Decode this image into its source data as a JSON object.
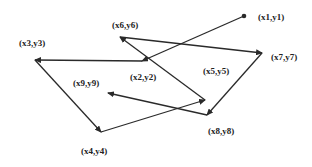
{
  "diagram": {
    "type": "directed-path",
    "colors": {
      "line": "#2a2a2a",
      "label": "#222222",
      "background": "#ffffff"
    },
    "start_marker": "dot",
    "points": [
      {
        "id": "p1",
        "label": "(x1,y1)",
        "x": 244,
        "y": 16,
        "lx": 258,
        "ly": 20
      },
      {
        "id": "p2",
        "label": "(x2,y2)",
        "x": 142,
        "y": 61,
        "lx": 130,
        "ly": 80
      },
      {
        "id": "p3",
        "label": "(x3,y3)",
        "x": 35,
        "y": 60,
        "lx": 19,
        "ly": 46
      },
      {
        "id": "p4",
        "label": "(x4,y4)",
        "x": 101,
        "y": 132,
        "lx": 81,
        "ly": 154
      },
      {
        "id": "p5",
        "label": "(x5,y5)",
        "x": 205,
        "y": 100,
        "lx": 203,
        "ly": 74
      },
      {
        "id": "p6",
        "label": "(x6,y6)",
        "x": 120,
        "y": 37,
        "lx": 112,
        "ly": 28
      },
      {
        "id": "p7",
        "label": "(x7,y7)",
        "x": 262,
        "y": 53,
        "lx": 271,
        "ly": 60
      },
      {
        "id": "p8",
        "label": "(x8,y8)",
        "x": 207,
        "y": 115,
        "lx": 208,
        "ly": 134
      },
      {
        "id": "p9",
        "label": "(x9,y9)",
        "x": 108,
        "y": 93,
        "lx": 73,
        "ly": 86
      }
    ],
    "edges": [
      {
        "from": "p1",
        "to": "p2"
      },
      {
        "from": "p2",
        "to": "p3"
      },
      {
        "from": "p3",
        "to": "p4"
      },
      {
        "from": "p4",
        "to": "p5"
      },
      {
        "from": "p5",
        "to": "p6"
      },
      {
        "from": "p6",
        "to": "p7"
      },
      {
        "from": "p7",
        "to": "p8"
      },
      {
        "from": "p8",
        "to": "p9"
      }
    ]
  }
}
